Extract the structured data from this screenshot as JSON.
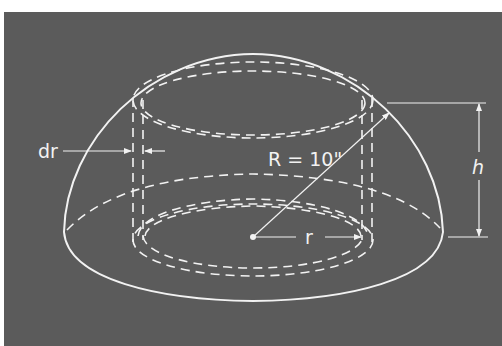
{
  "figure": {
    "type": "geometric-diagram",
    "background_color": "#5b5b5b",
    "line_color": "#f2f2f2"
  },
  "labels": {
    "thickness": "dr",
    "radius_sphere": "R = 10\"",
    "radius_shell": "r",
    "height": "h"
  },
  "elements": [
    {
      "name": "hemisphere-outline",
      "style": "solid"
    },
    {
      "name": "hemisphere-equator-back",
      "style": "dashed"
    },
    {
      "name": "cylindrical-shell",
      "style": "dashed"
    },
    {
      "name": "radius-R-line",
      "style": "solid-arrow"
    },
    {
      "name": "radius-r-arrow",
      "style": "solid-arrow"
    },
    {
      "name": "height-h-dimension",
      "style": "solid-arrow"
    },
    {
      "name": "thickness-dr-arrows",
      "style": "solid-arrow"
    }
  ]
}
